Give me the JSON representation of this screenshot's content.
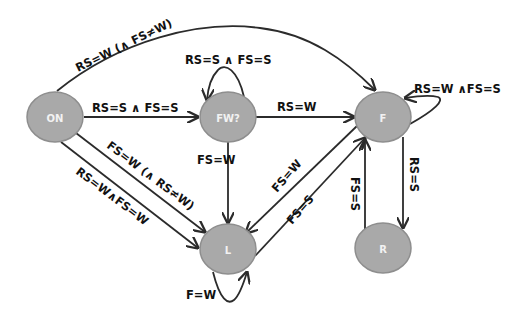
{
  "diagram": {
    "type": "state-machine",
    "nodes": [
      {
        "id": "ON",
        "label": "ON"
      },
      {
        "id": "FW",
        "label": "FW?"
      },
      {
        "id": "F",
        "label": "F"
      },
      {
        "id": "L",
        "label": "L"
      },
      {
        "id": "R",
        "label": "R"
      }
    ],
    "edges": [
      {
        "from": "ON",
        "to": "F",
        "label": "RS=W (∧ FS≠W)"
      },
      {
        "from": "ON",
        "to": "FW",
        "label": "RS=S ∧ FS=S"
      },
      {
        "from": "FW",
        "to": "FW",
        "label": "RS=S ∧ FS=S"
      },
      {
        "from": "FW",
        "to": "F",
        "label": "RS=W"
      },
      {
        "from": "F",
        "to": "F",
        "label": "RS=W ∧FS=S"
      },
      {
        "from": "ON",
        "to": "L",
        "label": "FS=W (∧ RS≠W)"
      },
      {
        "from": "ON",
        "to": "L",
        "label": "RS=W∧FS=W"
      },
      {
        "from": "FW",
        "to": "L",
        "label": "FS=W"
      },
      {
        "from": "F",
        "to": "L",
        "label": "FS=W"
      },
      {
        "from": "L",
        "to": "F",
        "label": "FS=S"
      },
      {
        "from": "R",
        "to": "F",
        "label": "FS=S"
      },
      {
        "from": "F",
        "to": "R",
        "label": "RS=S"
      },
      {
        "from": "L",
        "to": "L",
        "label": "F=W"
      }
    ]
  }
}
